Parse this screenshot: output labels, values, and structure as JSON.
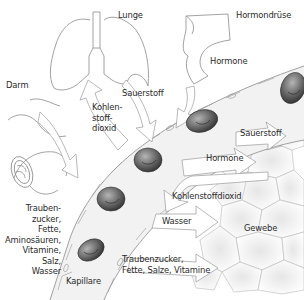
{
  "diagram": {
    "labels": {
      "lunge": "Lunge",
      "hormondruese": "Hormondrüse",
      "darm": "Darm",
      "sauerstoff_top": "Sauerstoff",
      "hormone_top": "Hormone",
      "kohlenstoffdioxid_left": "Kohlen-\nstoff-\ndioxid",
      "sauerstoff_right": "Sauerstoff",
      "hormone_right": "Hormone",
      "kohlenstoffdioxid_right": "Kohlenstoffdioxid",
      "wasser": "Wasser",
      "gewebe": "Gewebe",
      "naehrstoffe_left": "Trauben-\nzucker,\nFette,\nAminosäuren,\nVitamine,\nSalz,\nWasser",
      "naehrstoffe_right": "Traubenzucker,\nFette, Salze, Vitamine",
      "kapillare": "Kapillare"
    },
    "colors": {
      "line": "#8a8a8a",
      "text": "#2a2a2a",
      "cell_dark": "#4a4a4a",
      "cell_light": "#a8a8a8",
      "capillary_fill": "#f2f2f2"
    },
    "icons": {
      "lung": "lung-icon",
      "gland": "gland-icon",
      "intestine": "intestine-icon",
      "red_blood_cell": "red-blood-cell-icon",
      "tissue": "tissue-cells-icon"
    }
  }
}
